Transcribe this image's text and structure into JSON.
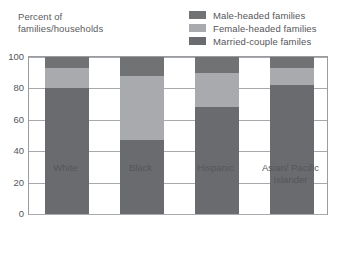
{
  "chart_data": {
    "type": "bar",
    "subtype": "stacked-vertical",
    "title": "Percent of families/households",
    "xlabel": "",
    "ylabel": "Percent of families/households",
    "ylim": [
      0,
      100
    ],
    "yticks": [
      0,
      20,
      40,
      60,
      80,
      100
    ],
    "ytick_labels": [
      "0",
      "20",
      "40",
      "60",
      "80",
      "100"
    ],
    "grid": true,
    "grid_axis": "y",
    "legend_position": "top-right",
    "categories": [
      "White",
      "Black",
      "Hispanic",
      "Asian/ Pacific Islander"
    ],
    "series": [
      {
        "name": "Married-couple familes",
        "color": "#6a6b6e",
        "values": [
          80,
          47,
          68,
          82
        ],
        "stack_order": 0
      },
      {
        "name": "Female-headed families",
        "color": "#a9aaad",
        "values": [
          13,
          41,
          22,
          11
        ],
        "stack_order": 1
      },
      {
        "name": "Male-headed families",
        "color": "#717274",
        "values": [
          7,
          12,
          10,
          7
        ],
        "stack_order": 2
      }
    ],
    "legend_entries": [
      {
        "label": "Male-headed families",
        "color": "#717274"
      },
      {
        "label": "Female-headed families",
        "color": "#a9aaad"
      },
      {
        "label": "Married-couple familes",
        "color": "#6a6b6e"
      }
    ]
  },
  "header": {
    "axis_title": "Percent of\nfamilies/households"
  },
  "colors": {
    "frame": "#9b9ca0",
    "gridline": "#a8a9ad",
    "text": "#55565a",
    "background": "#ffffff"
  }
}
